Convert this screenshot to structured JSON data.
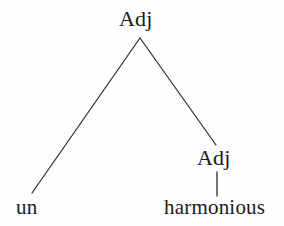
{
  "figure": {
    "kind": "syntax-tree",
    "background_color": "#fefefe",
    "line_color": "#2b2b2b",
    "text_color": "#1a1a1a"
  },
  "tree": {
    "root": {
      "label": "Adj",
      "x": 140,
      "y": 20
    },
    "children": [
      {
        "label": "un",
        "type": "terminal",
        "x": 29,
        "y": 207
      },
      {
        "label": "Adj",
        "type": "category",
        "x": 217,
        "y": 159,
        "child": {
          "label": "harmonious",
          "type": "terminal",
          "x": 218,
          "y": 207
        }
      }
    ]
  },
  "edges": [
    {
      "name": "root-to-un",
      "x1": 140,
      "y1": 38,
      "x2": 32,
      "y2": 193
    },
    {
      "name": "root-to-adj",
      "x1": 140,
      "y1": 38,
      "x2": 216,
      "y2": 145
    },
    {
      "name": "adj-to-harmonious",
      "x1": 217,
      "y1": 172,
      "x2": 217,
      "y2": 196
    }
  ],
  "labels": {
    "root": "Adj",
    "adj_right": "Adj",
    "un": "un",
    "harmonious": "harmonious"
  }
}
